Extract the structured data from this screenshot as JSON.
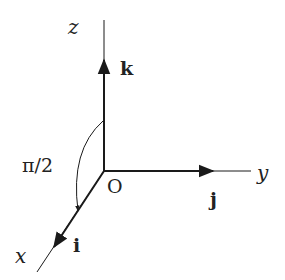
{
  "diagram": {
    "origin": {
      "label": "O"
    },
    "axes": [
      {
        "name": "x",
        "label": "x",
        "unit_vector": "i"
      },
      {
        "name": "y",
        "label": "y",
        "unit_vector": "j"
      },
      {
        "name": "z",
        "label": "z",
        "unit_vector": "k"
      }
    ],
    "angle": {
      "label": "π/2",
      "from": "z",
      "to": "x"
    },
    "colors": {
      "stroke": "#1a1a1a",
      "background": "#ffffff"
    }
  }
}
